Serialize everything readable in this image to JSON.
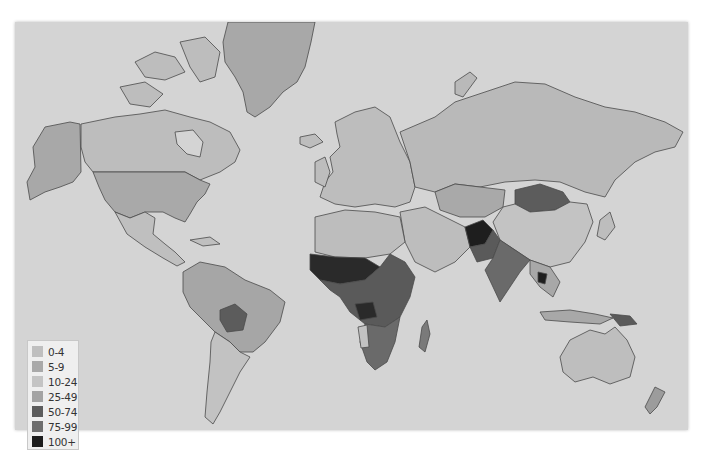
{
  "map": {
    "title": "",
    "background": "#d4d4d4",
    "ocean_color": "#d4d4d4"
  },
  "legend": {
    "items": [
      {
        "label": "0-4",
        "color": "#bfbfbf"
      },
      {
        "label": "5-9",
        "color": "#a9a9a9"
      },
      {
        "label": "10-24",
        "color": "#c4c4c4"
      },
      {
        "label": "25-49",
        "color": "#a3a3a3"
      },
      {
        "label": "50-74",
        "color": "#5c5c5c"
      },
      {
        "label": "75-99",
        "color": "#6e6e6e"
      },
      {
        "label": "100+",
        "color": "#1c1c1c"
      }
    ]
  },
  "regions": {
    "alaska": "#a8a8a8",
    "canada": "#bdbdbd",
    "usa": "#a9a9a9",
    "mexico": "#bfbfbf",
    "greenland": "#a8a8a8",
    "south_america": "#a6a6a6",
    "argentina": "#c2c2c2",
    "bolivia": "#5c5c5c",
    "europe": "#bdbdbd",
    "russia": "#b9b9b9",
    "kazakhstan": "#a9a9a9",
    "mongolia": "#5c5c5c",
    "china": "#c3c3c3",
    "india": "#6a6a6a",
    "afghanistan": "#1e1e1e",
    "pakistan": "#5a5a5a",
    "middle_east": "#bdbdbd",
    "north_africa": "#bdbdbd",
    "sahel": "#2a2a2a",
    "central_africa": "#5a5a5a",
    "southern_africa": "#6a6a6a",
    "madagascar": "#7a7a7a",
    "southeast_asia": "#a8a8a8",
    "australia": "#bebebe",
    "new_zealand": "#9c9c9c",
    "papua": "#5a5a5a",
    "japan": "#bdbdbd"
  }
}
